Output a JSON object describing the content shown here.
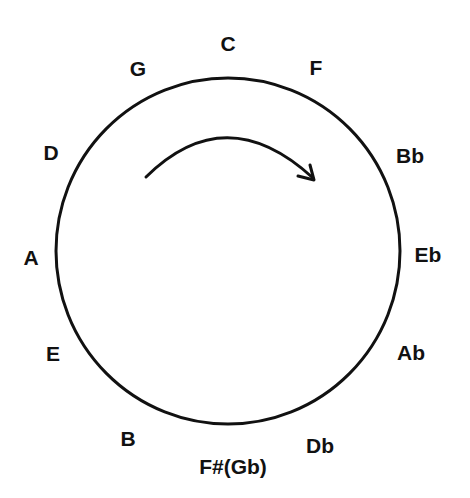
{
  "diagram": {
    "direction_arrow": "clockwise",
    "stroke_color": "#111111",
    "background": "#ffffff",
    "keys": [
      {
        "label": "C",
        "x": 228,
        "y": 43
      },
      {
        "label": "F",
        "x": 316,
        "y": 67
      },
      {
        "label": "Bb",
        "x": 410,
        "y": 155
      },
      {
        "label": "Eb",
        "x": 428,
        "y": 254
      },
      {
        "label": "Ab",
        "x": 411,
        "y": 352
      },
      {
        "label": "Db",
        "x": 320,
        "y": 445
      },
      {
        "label": "F#(Gb)",
        "x": 233,
        "y": 466
      },
      {
        "label": "B",
        "x": 128,
        "y": 438
      },
      {
        "label": "E",
        "x": 53,
        "y": 353
      },
      {
        "label": "A",
        "x": 31,
        "y": 257
      },
      {
        "label": "D",
        "x": 51,
        "y": 152
      },
      {
        "label": "G",
        "x": 138,
        "y": 68
      }
    ]
  }
}
